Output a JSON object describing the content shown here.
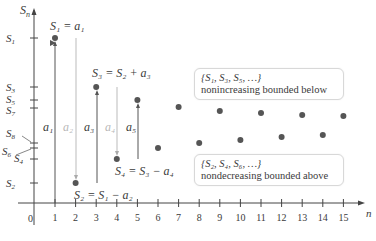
{
  "axes": {
    "y_label": "S",
    "y_label_sub": "n",
    "x_label": "n",
    "origin_label": "0",
    "x_ticks": [
      "1",
      "2",
      "3",
      "4",
      "5",
      "6",
      "7",
      "8",
      "9",
      "10",
      "11",
      "12",
      "13",
      "14",
      "15"
    ],
    "y_ticks": [
      {
        "name": "S",
        "sub": "1"
      },
      {
        "name": "S",
        "sub": "3"
      },
      {
        "name": "S",
        "sub": "5"
      },
      {
        "name": "S",
        "sub": "7"
      },
      {
        "name": "S",
        "sub": "8"
      },
      {
        "name": "S",
        "sub": "6"
      },
      {
        "name": "S",
        "sub": "4"
      },
      {
        "name": "S",
        "sub": "2"
      }
    ]
  },
  "annotations": {
    "s1": "S₁ = a₁",
    "s2": "S₂ = S₁ − a₂",
    "s3": "S₃ = S₂ + a₃",
    "s4": "S₄ = S₃ − a₄",
    "a1": "a₁",
    "a2": "a₂",
    "a3": "a₃",
    "a4": "a₄",
    "a5": "a₅"
  },
  "boxes": {
    "odd": {
      "set": "{S₁, S₃, S₅, …}",
      "desc": "nonincreasing bounded below"
    },
    "even": {
      "set": "{S₂, S₄, S₆, …}",
      "desc": "nondecreasing bounded above"
    }
  },
  "chart_data": {
    "type": "scatter",
    "title": "",
    "xlabel": "n",
    "ylabel": "S_n",
    "x": [
      1,
      2,
      3,
      4,
      5,
      6,
      7,
      8,
      9,
      10,
      11,
      12,
      13,
      14,
      15
    ],
    "y_pixel_positions": [
      38,
      183,
      87,
      159,
      100,
      148,
      107,
      143,
      111,
      140,
      113,
      137,
      115,
      135,
      116
    ],
    "grid": false
  }
}
